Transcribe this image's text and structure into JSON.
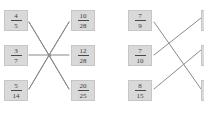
{
  "page": {
    "background_color": "#ffffff",
    "box_fill_color": "#d9d9d9",
    "box_border_color": "#c6c6c6",
    "line_color": "#8a8a8a",
    "text_color": "#3a3a3a"
  },
  "groups": [
    {
      "id": "group-1",
      "name": "matching-group-1",
      "hub": {
        "x": 49,
        "y": 55,
        "visible": true
      },
      "left_items": [
        {
          "numerator": "4",
          "denominator": "5",
          "x": 4,
          "y": 10
        },
        {
          "numerator": "3",
          "denominator": "7",
          "x": 4,
          "y": 45
        },
        {
          "numerator": "5",
          "denominator": "14",
          "x": 4,
          "y": 80
        }
      ],
      "right_items": [
        {
          "numerator": "10",
          "denominator": "28",
          "x": 71,
          "y": 10
        },
        {
          "numerator": "12",
          "denominator": "28",
          "x": 71,
          "y": 45
        },
        {
          "numerator": "20",
          "denominator": "25",
          "x": 71,
          "y": 80
        }
      ],
      "connectors": [
        {
          "from": "left-1",
          "to": "right-3",
          "x1": 29,
          "y1": 22,
          "x2": 69,
          "y2": 89
        },
        {
          "from": "left-2",
          "to": "right-2",
          "x1": 29,
          "y1": 55,
          "x2": 69,
          "y2": 55
        },
        {
          "from": "left-3",
          "to": "right-1",
          "x1": 29,
          "y1": 89,
          "x2": 69,
          "y2": 22
        },
        {
          "from": "left-1b",
          "to": "hub",
          "x1": 29,
          "y1": 22,
          "x2": 49,
          "y2": 55
        },
        {
          "from": "left-3b",
          "to": "hub",
          "x1": 29,
          "y1": 89,
          "x2": 49,
          "y2": 55
        },
        {
          "from": "right-1b",
          "to": "hub",
          "x1": 69,
          "y1": 22,
          "x2": 49,
          "y2": 55
        },
        {
          "from": "right-3b",
          "to": "hub",
          "x1": 69,
          "y1": 89,
          "x2": 49,
          "y2": 55
        }
      ]
    },
    {
      "id": "group-2",
      "name": "matching-group-2",
      "hub": {
        "x": 0,
        "y": 0,
        "visible": false
      },
      "left_items": [
        {
          "numerator": "7",
          "denominator": "9",
          "x": 26,
          "y": 10
        },
        {
          "numerator": "7",
          "denominator": "10",
          "x": 26,
          "y": 45
        },
        {
          "numerator": "8",
          "denominator": "15",
          "x": 26,
          "y": 80
        }
      ],
      "right_items": [
        {
          "numerator": "",
          "denominator": "",
          "x": 99,
          "y": 10,
          "clipped": true
        },
        {
          "numerator": "",
          "denominator": "",
          "x": 99,
          "y": 45,
          "clipped": true
        },
        {
          "numerator": "",
          "denominator": "",
          "x": 99,
          "y": 80,
          "clipped": true
        }
      ],
      "connectors": [
        {
          "from": "left-1",
          "to": "right-3",
          "x1": 52,
          "y1": 22,
          "x2": 99,
          "y2": 89
        },
        {
          "from": "left-2",
          "to": "right-1",
          "x1": 52,
          "y1": 55,
          "x2": 99,
          "y2": 18
        },
        {
          "from": "left-3",
          "to": "right-2",
          "x1": 52,
          "y1": 89,
          "x2": 99,
          "y2": 50
        }
      ]
    }
  ]
}
